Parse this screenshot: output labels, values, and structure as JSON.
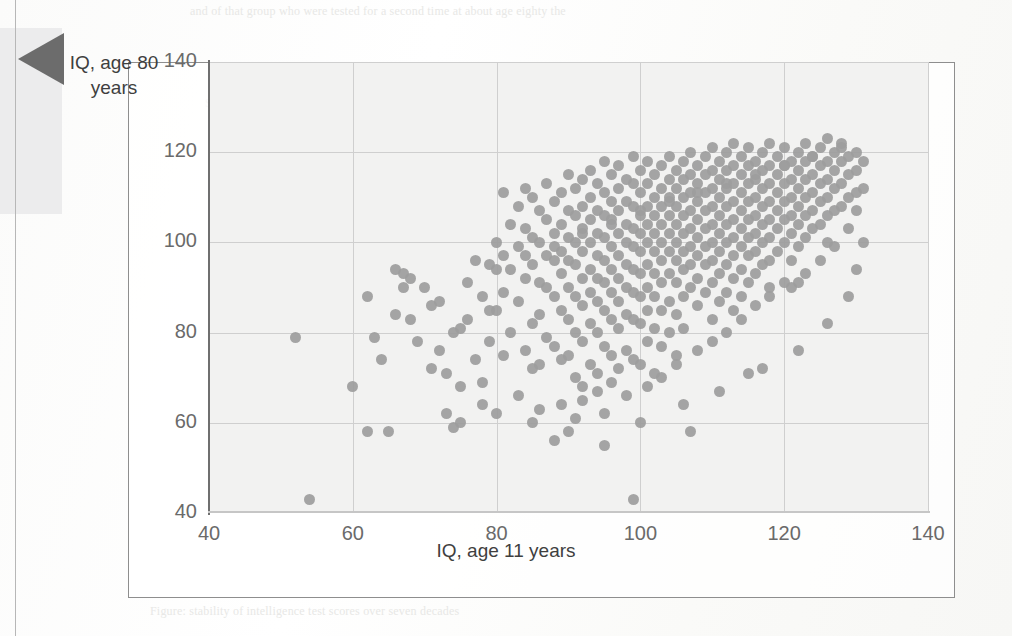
{
  "page": {
    "bleed_text_top": "and of that group who were tested for a second time at about age eighty the",
    "bleed_text_right": "scores at age eleven and again later in life. The\ncorrelation is strong but far from perfect, leaving\nroom for substantial change across the lifespan.\nSome individuals rise, others fall, and the spread\nwidens at the extremes of the distribution.",
    "bleed_text_left": "110\n\n90\n\n70",
    "bleed_text_center": "Scatterplot of childhood and old-age test scores",
    "bleed_text_bottom": "Figure: stability of intelligence test scores over seven decades"
  },
  "figure": {
    "callout_icon": "left-pointing-triangle-marker"
  },
  "chart_data": {
    "type": "scatter",
    "title": "",
    "xlabel": "IQ, age 11 years",
    "ylabel": "IQ, age 80 years",
    "xlim": [
      40,
      140
    ],
    "ylim": [
      40,
      140
    ],
    "xticks": [
      40,
      60,
      80,
      100,
      120,
      140
    ],
    "yticks": [
      40,
      60,
      80,
      100,
      120,
      140
    ],
    "grid": true,
    "legend": "none",
    "marker": {
      "shape": "circle",
      "color": "#9d9d9d",
      "size_px": 11
    },
    "plot_background": "#f2f2f1",
    "n_points": 448,
    "points": [
      [
        52,
        79
      ],
      [
        54,
        43
      ],
      [
        60,
        68
      ],
      [
        62,
        88
      ],
      [
        62,
        58
      ],
      [
        65,
        58
      ],
      [
        66,
        84
      ],
      [
        64,
        74
      ],
      [
        67,
        93
      ],
      [
        68,
        92
      ],
      [
        69,
        78
      ],
      [
        70,
        90
      ],
      [
        71,
        72
      ],
      [
        72,
        76
      ],
      [
        73,
        71
      ],
      [
        73,
        62
      ],
      [
        74,
        59
      ],
      [
        75,
        60
      ],
      [
        75,
        81
      ],
      [
        76,
        83
      ],
      [
        77,
        74
      ],
      [
        78,
        69
      ],
      [
        78,
        88
      ],
      [
        79,
        95
      ],
      [
        79,
        78
      ],
      [
        80,
        100
      ],
      [
        80,
        85
      ],
      [
        80,
        62
      ],
      [
        81,
        111
      ],
      [
        81,
        97
      ],
      [
        81,
        89
      ],
      [
        82,
        104
      ],
      [
        82,
        94
      ],
      [
        82,
        80
      ],
      [
        83,
        108
      ],
      [
        83,
        99
      ],
      [
        83,
        87
      ],
      [
        84,
        112
      ],
      [
        84,
        103
      ],
      [
        84,
        92
      ],
      [
        84,
        76
      ],
      [
        85,
        110
      ],
      [
        85,
        101
      ],
      [
        85,
        95
      ],
      [
        85,
        82
      ],
      [
        85,
        72
      ],
      [
        86,
        107
      ],
      [
        86,
        100
      ],
      [
        86,
        91
      ],
      [
        86,
        84
      ],
      [
        86,
        73
      ],
      [
        87,
        113
      ],
      [
        87,
        105
      ],
      [
        87,
        97
      ],
      [
        87,
        90
      ],
      [
        87,
        79
      ],
      [
        88,
        109
      ],
      [
        88,
        102
      ],
      [
        88,
        96
      ],
      [
        88,
        88
      ],
      [
        88,
        77
      ],
      [
        88,
        56
      ],
      [
        89,
        111
      ],
      [
        89,
        104
      ],
      [
        89,
        98
      ],
      [
        89,
        93
      ],
      [
        89,
        85
      ],
      [
        89,
        74
      ],
      [
        90,
        115
      ],
      [
        90,
        107
      ],
      [
        90,
        101
      ],
      [
        90,
        96
      ],
      [
        90,
        90
      ],
      [
        90,
        83
      ],
      [
        90,
        75
      ],
      [
        91,
        112
      ],
      [
        91,
        106
      ],
      [
        91,
        100
      ],
      [
        91,
        95
      ],
      [
        91,
        88
      ],
      [
        91,
        80
      ],
      [
        91,
        70
      ],
      [
        92,
        114
      ],
      [
        92,
        108
      ],
      [
        92,
        103
      ],
      [
        92,
        98
      ],
      [
        92,
        92
      ],
      [
        92,
        86
      ],
      [
        92,
        78
      ],
      [
        92,
        68
      ],
      [
        93,
        116
      ],
      [
        93,
        110
      ],
      [
        93,
        105
      ],
      [
        93,
        100
      ],
      [
        93,
        94
      ],
      [
        93,
        89
      ],
      [
        93,
        82
      ],
      [
        93,
        73
      ],
      [
        94,
        113
      ],
      [
        94,
        107
      ],
      [
        94,
        102
      ],
      [
        94,
        97
      ],
      [
        94,
        92
      ],
      [
        94,
        87
      ],
      [
        94,
        80
      ],
      [
        94,
        71
      ],
      [
        95,
        118
      ],
      [
        95,
        111
      ],
      [
        95,
        106
      ],
      [
        95,
        101
      ],
      [
        95,
        96
      ],
      [
        95,
        91
      ],
      [
        95,
        85
      ],
      [
        95,
        77
      ],
      [
        95,
        55
      ],
      [
        96,
        115
      ],
      [
        96,
        109
      ],
      [
        96,
        104
      ],
      [
        96,
        99
      ],
      [
        96,
        94
      ],
      [
        96,
        89
      ],
      [
        96,
        83
      ],
      [
        96,
        75
      ],
      [
        97,
        117
      ],
      [
        97,
        112
      ],
      [
        97,
        107
      ],
      [
        97,
        102
      ],
      [
        97,
        97
      ],
      [
        97,
        92
      ],
      [
        97,
        87
      ],
      [
        97,
        81
      ],
      [
        97,
        72
      ],
      [
        98,
        114
      ],
      [
        98,
        109
      ],
      [
        98,
        104
      ],
      [
        98,
        100
      ],
      [
        98,
        95
      ],
      [
        98,
        90
      ],
      [
        98,
        84
      ],
      [
        98,
        76
      ],
      [
        99,
        119
      ],
      [
        99,
        113
      ],
      [
        99,
        108
      ],
      [
        99,
        103
      ],
      [
        99,
        99
      ],
      [
        99,
        94
      ],
      [
        99,
        89
      ],
      [
        99,
        83
      ],
      [
        99,
        74
      ],
      [
        99,
        43
      ],
      [
        100,
        116
      ],
      [
        100,
        111
      ],
      [
        100,
        106
      ],
      [
        100,
        102
      ],
      [
        100,
        98
      ],
      [
        100,
        93
      ],
      [
        100,
        88
      ],
      [
        100,
        82
      ],
      [
        100,
        73
      ],
      [
        101,
        118
      ],
      [
        101,
        113
      ],
      [
        101,
        108
      ],
      [
        101,
        104
      ],
      [
        101,
        100
      ],
      [
        101,
        95
      ],
      [
        101,
        90
      ],
      [
        101,
        85
      ],
      [
        101,
        78
      ],
      [
        102,
        115
      ],
      [
        102,
        110
      ],
      [
        102,
        106
      ],
      [
        102,
        102
      ],
      [
        102,
        98
      ],
      [
        102,
        93
      ],
      [
        102,
        88
      ],
      [
        102,
        81
      ],
      [
        102,
        71
      ],
      [
        103,
        117
      ],
      [
        103,
        112
      ],
      [
        103,
        108
      ],
      [
        103,
        104
      ],
      [
        103,
        100
      ],
      [
        103,
        96
      ],
      [
        103,
        91
      ],
      [
        103,
        85
      ],
      [
        103,
        77
      ],
      [
        104,
        119
      ],
      [
        104,
        114
      ],
      [
        104,
        110
      ],
      [
        104,
        106
      ],
      [
        104,
        102
      ],
      [
        104,
        98
      ],
      [
        104,
        93
      ],
      [
        104,
        87
      ],
      [
        104,
        80
      ],
      [
        105,
        116
      ],
      [
        105,
        112
      ],
      [
        105,
        108
      ],
      [
        105,
        104
      ],
      [
        105,
        100
      ],
      [
        105,
        96
      ],
      [
        105,
        91
      ],
      [
        105,
        84
      ],
      [
        105,
        75
      ],
      [
        106,
        118
      ],
      [
        106,
        114
      ],
      [
        106,
        110
      ],
      [
        106,
        106
      ],
      [
        106,
        102
      ],
      [
        106,
        98
      ],
      [
        106,
        94
      ],
      [
        106,
        88
      ],
      [
        106,
        81
      ],
      [
        107,
        120
      ],
      [
        107,
        115
      ],
      [
        107,
        111
      ],
      [
        107,
        107
      ],
      [
        107,
        103
      ],
      [
        107,
        99
      ],
      [
        107,
        95
      ],
      [
        107,
        90
      ],
      [
        107,
        58
      ],
      [
        108,
        117
      ],
      [
        108,
        113
      ],
      [
        108,
        109
      ],
      [
        108,
        105
      ],
      [
        108,
        101
      ],
      [
        108,
        97
      ],
      [
        108,
        92
      ],
      [
        108,
        86
      ],
      [
        109,
        119
      ],
      [
        109,
        115
      ],
      [
        109,
        111
      ],
      [
        109,
        107
      ],
      [
        109,
        103
      ],
      [
        109,
        99
      ],
      [
        109,
        95
      ],
      [
        109,
        89
      ],
      [
        110,
        121
      ],
      [
        110,
        116
      ],
      [
        110,
        112
      ],
      [
        110,
        108
      ],
      [
        110,
        104
      ],
      [
        110,
        100
      ],
      [
        110,
        96
      ],
      [
        110,
        91
      ],
      [
        110,
        83
      ],
      [
        111,
        118
      ],
      [
        111,
        114
      ],
      [
        111,
        110
      ],
      [
        111,
        106
      ],
      [
        111,
        102
      ],
      [
        111,
        98
      ],
      [
        111,
        93
      ],
      [
        111,
        87
      ],
      [
        112,
        120
      ],
      [
        112,
        116
      ],
      [
        112,
        112
      ],
      [
        112,
        108
      ],
      [
        112,
        104
      ],
      [
        112,
        100
      ],
      [
        112,
        95
      ],
      [
        112,
        89
      ],
      [
        113,
        122
      ],
      [
        113,
        117
      ],
      [
        113,
        113
      ],
      [
        113,
        109
      ],
      [
        113,
        105
      ],
      [
        113,
        101
      ],
      [
        113,
        97
      ],
      [
        113,
        92
      ],
      [
        113,
        85
      ],
      [
        114,
        119
      ],
      [
        114,
        115
      ],
      [
        114,
        111
      ],
      [
        114,
        107
      ],
      [
        114,
        103
      ],
      [
        114,
        99
      ],
      [
        114,
        94
      ],
      [
        114,
        88
      ],
      [
        115,
        121
      ],
      [
        115,
        117
      ],
      [
        115,
        113
      ],
      [
        115,
        109
      ],
      [
        115,
        105
      ],
      [
        115,
        101
      ],
      [
        115,
        97
      ],
      [
        115,
        91
      ],
      [
        115,
        71
      ],
      [
        116,
        118
      ],
      [
        116,
        114
      ],
      [
        116,
        110
      ],
      [
        116,
        106
      ],
      [
        116,
        102
      ],
      [
        116,
        98
      ],
      [
        116,
        93
      ],
      [
        117,
        120
      ],
      [
        117,
        116
      ],
      [
        117,
        112
      ],
      [
        117,
        108
      ],
      [
        117,
        104
      ],
      [
        117,
        100
      ],
      [
        117,
        95
      ],
      [
        118,
        122
      ],
      [
        118,
        117
      ],
      [
        118,
        113
      ],
      [
        118,
        109
      ],
      [
        118,
        105
      ],
      [
        118,
        101
      ],
      [
        118,
        96
      ],
      [
        118,
        90
      ],
      [
        119,
        119
      ],
      [
        119,
        115
      ],
      [
        119,
        111
      ],
      [
        119,
        107
      ],
      [
        119,
        103
      ],
      [
        119,
        98
      ],
      [
        120,
        121
      ],
      [
        120,
        117
      ],
      [
        120,
        113
      ],
      [
        120,
        109
      ],
      [
        120,
        105
      ],
      [
        120,
        100
      ],
      [
        120,
        91
      ],
      [
        121,
        118
      ],
      [
        121,
        114
      ],
      [
        121,
        110
      ],
      [
        121,
        106
      ],
      [
        121,
        102
      ],
      [
        121,
        96
      ],
      [
        122,
        120
      ],
      [
        122,
        116
      ],
      [
        122,
        112
      ],
      [
        122,
        108
      ],
      [
        122,
        104
      ],
      [
        122,
        99
      ],
      [
        122,
        91
      ],
      [
        123,
        122
      ],
      [
        123,
        118
      ],
      [
        123,
        114
      ],
      [
        123,
        110
      ],
      [
        123,
        106
      ],
      [
        123,
        101
      ],
      [
        124,
        119
      ],
      [
        124,
        115
      ],
      [
        124,
        111
      ],
      [
        124,
        107
      ],
      [
        124,
        103
      ],
      [
        125,
        121
      ],
      [
        125,
        117
      ],
      [
        125,
        113
      ],
      [
        125,
        109
      ],
      [
        125,
        104
      ],
      [
        126,
        123
      ],
      [
        126,
        118
      ],
      [
        126,
        114
      ],
      [
        126,
        110
      ],
      [
        126,
        106
      ],
      [
        126,
        100
      ],
      [
        127,
        120
      ],
      [
        127,
        116
      ],
      [
        127,
        112
      ],
      [
        127,
        107
      ],
      [
        128,
        122
      ],
      [
        128,
        118
      ],
      [
        128,
        113
      ],
      [
        128,
        108
      ],
      [
        129,
        119
      ],
      [
        129,
        115
      ],
      [
        129,
        110
      ],
      [
        130,
        120
      ],
      [
        130,
        116
      ],
      [
        130,
        111
      ],
      [
        131,
        118
      ],
      [
        131,
        100
      ],
      [
        66,
        94
      ],
      [
        67,
        90
      ],
      [
        71,
        86
      ],
      [
        74,
        80
      ],
      [
        77,
        96
      ],
      [
        79,
        85
      ],
      [
        81,
        75
      ],
      [
        83,
        66
      ],
      [
        86,
        63
      ],
      [
        89,
        64
      ],
      [
        91,
        61
      ],
      [
        92,
        65
      ],
      [
        94,
        67
      ],
      [
        96,
        69
      ],
      [
        98,
        66
      ],
      [
        101,
        68
      ],
      [
        103,
        70
      ],
      [
        105,
        73
      ],
      [
        108,
        76
      ],
      [
        110,
        78
      ],
      [
        112,
        80
      ],
      [
        114,
        83
      ],
      [
        116,
        86
      ],
      [
        118,
        88
      ],
      [
        121,
        90
      ],
      [
        123,
        93
      ],
      [
        125,
        96
      ],
      [
        127,
        99
      ],
      [
        129,
        103
      ],
      [
        130,
        107
      ],
      [
        63,
        79
      ],
      [
        68,
        83
      ],
      [
        72,
        87
      ],
      [
        76,
        91
      ],
      [
        80,
        94
      ],
      [
        84,
        97
      ],
      [
        88,
        99
      ],
      [
        92,
        102
      ],
      [
        96,
        105
      ],
      [
        100,
        107
      ],
      [
        104,
        109
      ],
      [
        108,
        111
      ],
      [
        112,
        113
      ],
      [
        116,
        115
      ],
      [
        120,
        117
      ],
      [
        124,
        119
      ],
      [
        128,
        121
      ],
      [
        75,
        68
      ],
      [
        78,
        64
      ],
      [
        85,
        60
      ],
      [
        90,
        58
      ],
      [
        95,
        62
      ],
      [
        100,
        60
      ],
      [
        106,
        64
      ],
      [
        111,
        67
      ],
      [
        117,
        72
      ],
      [
        122,
        76
      ],
      [
        126,
        82
      ],
      [
        129,
        88
      ],
      [
        130,
        94
      ],
      [
        131,
        112
      ]
    ]
  }
}
